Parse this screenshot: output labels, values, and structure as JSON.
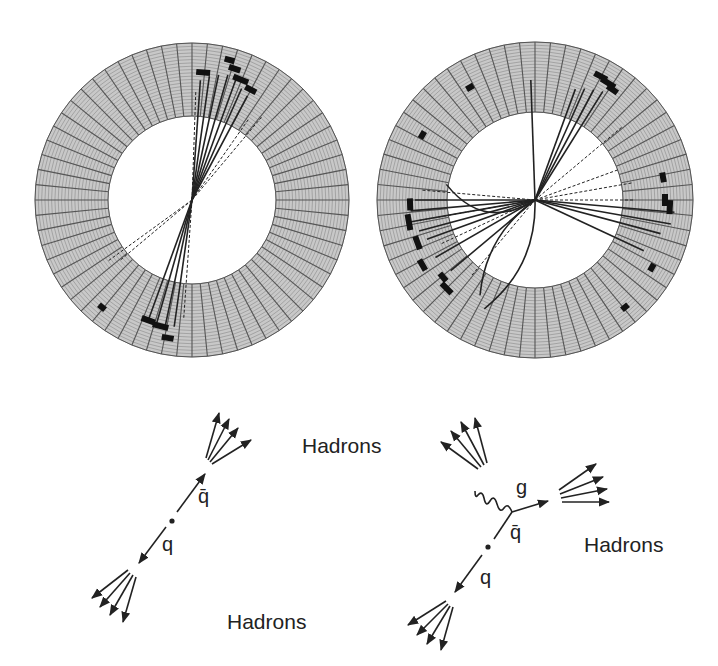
{
  "figure": {
    "panels": [
      {
        "id": "two-jet-event",
        "description": "Detector event display: two back-to-back jets",
        "ring": {
          "cx": 192,
          "cy": 200,
          "outer_r": 157,
          "inner_r": 84
        }
      },
      {
        "id": "three-jet-event",
        "description": "Detector event display: three-jet event",
        "ring": {
          "cx": 535,
          "cy": 200,
          "outer_r": 158,
          "inner_r": 88
        }
      }
    ],
    "diagram_left": {
      "labels": {
        "hadrons_top": "Hadrons",
        "hadrons_bottom": "Hadrons",
        "antiquark": "q̄",
        "quark": "q"
      }
    },
    "diagram_right": {
      "labels": {
        "hadrons_right": "Hadrons",
        "gluon": "g",
        "antiquark": "q̄",
        "quark": "q"
      }
    },
    "colors": {
      "ring_fill": "#c8c8c8",
      "grid_line": "#555555",
      "track": "#222222",
      "background": "#ffffff"
    }
  }
}
